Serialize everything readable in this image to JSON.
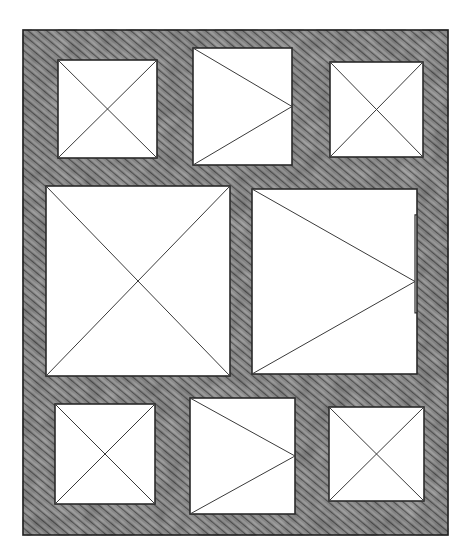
{
  "diagram": {
    "type": "wireframe-sketch",
    "colors": {
      "background": "#ffffff",
      "hatch_fill": "#8a8a8a",
      "hatch_dark": "#4a4a4a",
      "line": "#2a2a2a",
      "panel_fill": "#ffffff"
    },
    "frame": {
      "x": 23,
      "y": 30,
      "w": 425,
      "h": 505
    },
    "panels": [
      {
        "id": "top-left",
        "kind": "image-placeholder",
        "mark": "x",
        "x": 58,
        "y": 60,
        "w": 99,
        "h": 98
      },
      {
        "id": "top-center",
        "kind": "video-placeholder",
        "mark": "triangle",
        "x": 193,
        "y": 48,
        "w": 99,
        "h": 117
      },
      {
        "id": "top-right",
        "kind": "image-placeholder",
        "mark": "x",
        "x": 330,
        "y": 62,
        "w": 93,
        "h": 95
      },
      {
        "id": "middle-left",
        "kind": "image-placeholder",
        "mark": "x",
        "x": 46,
        "y": 186,
        "w": 184,
        "h": 190
      },
      {
        "id": "middle-right",
        "kind": "video-placeholder",
        "mark": "triangle",
        "x": 252,
        "y": 189,
        "w": 165,
        "h": 185,
        "notch": true
      },
      {
        "id": "bottom-left",
        "kind": "image-placeholder",
        "mark": "x",
        "x": 55,
        "y": 404,
        "w": 100,
        "h": 100
      },
      {
        "id": "bottom-center",
        "kind": "video-placeholder",
        "mark": "triangle",
        "x": 190,
        "y": 398,
        "w": 105,
        "h": 116
      },
      {
        "id": "bottom-right",
        "kind": "image-placeholder",
        "mark": "x",
        "x": 329,
        "y": 407,
        "w": 95,
        "h": 94
      }
    ]
  }
}
